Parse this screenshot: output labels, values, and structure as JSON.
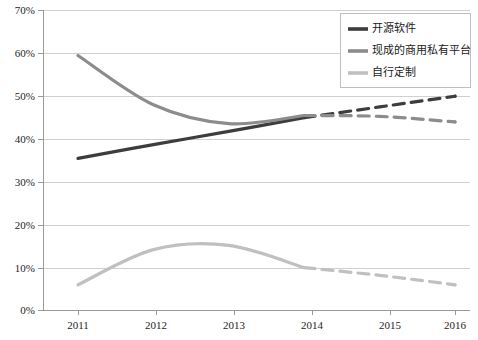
{
  "chart_data": {
    "type": "line",
    "title": "",
    "subtitle": "",
    "xlabel": "",
    "ylabel": "",
    "categories": [
      "2011",
      "2012",
      "2013",
      "2014",
      "2015",
      "2016"
    ],
    "x": [
      2011,
      2012,
      2013,
      2014,
      2015,
      2016
    ],
    "xlim": [
      2011,
      2016
    ],
    "ylim": [
      0,
      70
    ],
    "y_tick_labels": [
      "0%",
      "10%",
      "20%",
      "30%",
      "40%",
      "50%",
      "60%",
      "70%"
    ],
    "y_tick_values": [
      0,
      10,
      20,
      30,
      40,
      50,
      60,
      70
    ],
    "x_tick_labels": [
      "2011",
      "2012",
      "2013",
      "2014",
      "2015",
      "2016"
    ],
    "grid": "horizontal",
    "legend_position": "top-right",
    "y_unit": "%",
    "forecast_starts_at": 2014,
    "series": [
      {
        "name": "开源软件",
        "color": "#3d3d3d",
        "width": 3.2,
        "actual": [
          35.5,
          38.7,
          41.8,
          45.0
        ],
        "forecast": [
          45.0,
          47.5,
          50.0
        ],
        "values": [
          35.5,
          38.7,
          41.8,
          45.0,
          47.5,
          50.0
        ],
        "endpoint_value": 50.0
      },
      {
        "name": "现成的商用私有平台",
        "color": "#8c8c8c",
        "width": 3.2,
        "actual": [
          59.5,
          48.0,
          43.6,
          45.5
        ],
        "forecast": [
          45.5,
          45.3,
          44.0
        ],
        "values": [
          59.5,
          48.0,
          43.6,
          45.5,
          45.3,
          44.0
        ],
        "endpoint_value": 44.0
      },
      {
        "name": "自行定制",
        "color": "#c0c0c0",
        "width": 3.2,
        "actual": [
          6.0,
          14.2,
          15.2,
          10.0
        ],
        "forecast": [
          10.0,
          8.2,
          6.0
        ],
        "values": [
          6.0,
          14.2,
          15.2,
          10.0,
          8.2,
          6.0
        ],
        "endpoint_value": 6.0
      }
    ],
    "legend": [
      {
        "label": "开源软件",
        "color": "#3d3d3d"
      },
      {
        "label": "现成的商用私有平台",
        "color": "#8c8c8c"
      },
      {
        "label": "自行定制",
        "color": "#c0c0c0"
      }
    ],
    "annotations": []
  },
  "ticks": {
    "y": {
      "t0": "70%",
      "t1": "60%",
      "t2": "50%",
      "t3": "40%",
      "t4": "30%",
      "t5": "20%",
      "t6": "10%",
      "t7": "0%"
    },
    "x": {
      "t0": "2011",
      "t1": "2012",
      "t2": "2013",
      "t3": "2014",
      "t4": "2015",
      "t5": "2016"
    }
  },
  "legend": {
    "item0": "开源软件",
    "item1": "现成的商用私有平台",
    "item2": "自行定制"
  },
  "colors": {
    "series_open_source": "#3d3d3d",
    "series_commercial": "#8c8c8c",
    "series_custom": "#c0c0c0",
    "gridline": "#d0d0d0",
    "axis": "#9a9a9a",
    "background": "#ffffff",
    "text": "#262626"
  }
}
